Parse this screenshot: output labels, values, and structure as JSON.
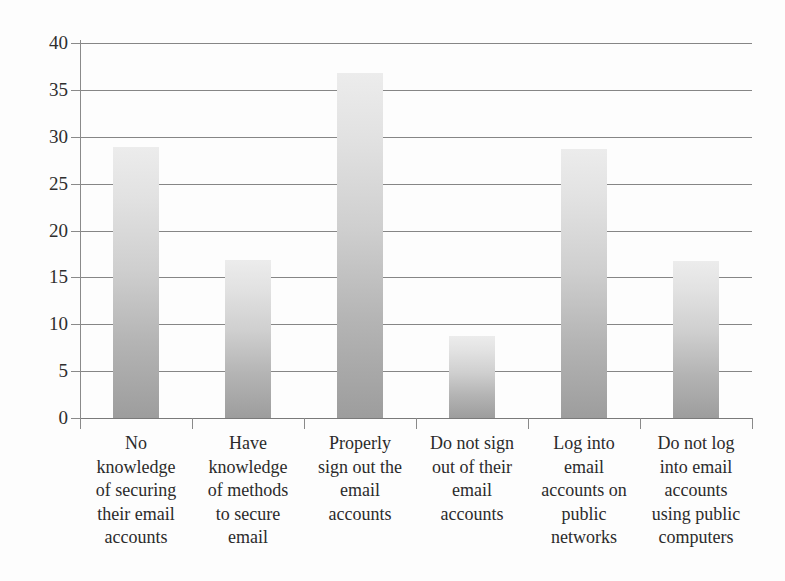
{
  "chart_data": {
    "type": "bar",
    "title": "",
    "subtitle": "",
    "xlabel": "",
    "ylabel": "",
    "ylim": [
      0,
      40
    ],
    "grid": true,
    "legend": false,
    "legend_position": "none",
    "orientation": "vertical",
    "categories": [
      "No knowledge of securing their email accounts",
      "Have knowledge of methods to secure email",
      "Properly sign out the email accounts",
      "Do not sign out of their email accounts",
      "Log into email accounts on public networks",
      "Do not  log into email accounts using public computers"
    ],
    "category_lines": [
      [
        "No",
        "knowledge",
        "of securing",
        "their email",
        "accounts"
      ],
      [
        "Have",
        "knowledge",
        "of methods",
        "to secure",
        "email"
      ],
      [
        "Properly",
        "sign out the",
        "email",
        "accounts"
      ],
      [
        "Do not sign",
        "out of their",
        "email",
        "accounts"
      ],
      [
        "Log into",
        "email",
        "accounts on",
        "public",
        "networks"
      ],
      [
        "Do not  log",
        "into email",
        "accounts",
        "using public",
        "computers"
      ]
    ],
    "values": [
      28.9,
      16.9,
      36.8,
      8.8,
      28.7,
      16.8
    ],
    "y_ticks": [
      0,
      5,
      10,
      15,
      20,
      25,
      30,
      35,
      40
    ],
    "y_tick_labels": [
      "0",
      "5",
      "10",
      "15",
      "20",
      "25",
      "30",
      "35",
      "40"
    ],
    "colors": {
      "bar_top": "#ececec",
      "bar_bottom": "#9d9d9d",
      "gridline": "#868686",
      "axis": "#8a8a8a",
      "text": "#2b2b2b",
      "background": "#fdfdfd"
    }
  }
}
